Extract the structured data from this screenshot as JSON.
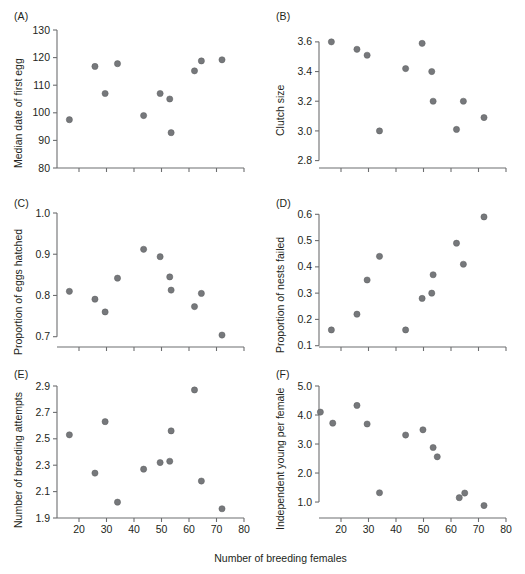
{
  "figure": {
    "width": 525,
    "height": 574,
    "shared_xlabel": "Number of breeding females",
    "point_color": "#76787b",
    "axis_color": "#6d6e70",
    "background": "#ffffff"
  },
  "panels": [
    {
      "label": "(A)",
      "ylabel": "Median date of first egg",
      "xticklabels": [
        "",
        "",
        "",
        "",
        "",
        "",
        "",
        ""
      ],
      "yticklabels": [
        "80",
        "90",
        "100",
        "110",
        "120",
        "130"
      ]
    },
    {
      "label": "(B)",
      "ylabel": "Clutch size",
      "xticklabels": [
        "",
        "",
        "",
        "",
        "",
        "",
        "",
        ""
      ],
      "yticklabels": [
        "2.8",
        "3.0",
        "3.2",
        "3.4",
        "3.6"
      ]
    },
    {
      "label": "(C)",
      "ylabel": "Proportion of eggs hatched",
      "xticklabels": [
        "",
        "",
        "",
        "",
        "",
        "",
        "",
        ""
      ],
      "yticklabels": [
        "0.7",
        "0.8",
        "0.9",
        "1.0"
      ]
    },
    {
      "label": "(D)",
      "ylabel": "Proportion of nests failed",
      "xticklabels": [
        "",
        "",
        "",
        "",
        "",
        "",
        "",
        ""
      ],
      "yticklabels": [
        "0.1",
        "0.2",
        "0.3",
        "0.4",
        "0.5",
        "0.6"
      ]
    },
    {
      "label": "(E)",
      "ylabel": "Number of breeding attempts",
      "xticklabels": [
        "20",
        "30",
        "40",
        "50",
        "60",
        "70",
        "80"
      ],
      "yticklabels": [
        "1.9",
        "2.1",
        "2.3",
        "2.5",
        "2.7",
        "2.9"
      ]
    },
    {
      "label": "(F)",
      "ylabel": "Independent young per female",
      "xticklabels": [
        "20",
        "30",
        "40",
        "50",
        "60",
        "70",
        "80"
      ],
      "yticklabels": [
        "1.0",
        "2.0",
        "3.0",
        "4.0",
        "5.0"
      ]
    }
  ],
  "chart_data": [
    {
      "type": "scatter",
      "panel": "(A)",
      "title": "",
      "xlabel": "Number of breeding females",
      "ylabel": "Median date of first egg",
      "xlim": [
        12,
        80
      ],
      "ylim": [
        80,
        130
      ],
      "xticks": [
        20,
        30,
        40,
        50,
        60,
        70,
        80
      ],
      "yticks": [
        80,
        90,
        100,
        110,
        120,
        130
      ],
      "grid": false,
      "legend": false,
      "x": [
        16.5,
        25.8,
        29.5,
        34.0,
        43.5,
        49.5,
        53.0,
        53.5,
        62.0,
        64.5,
        72.0
      ],
      "y": [
        97.5,
        116.8,
        107.0,
        117.8,
        99.0,
        107.0,
        105.0,
        92.8,
        115.2,
        118.8,
        119.2
      ]
    },
    {
      "type": "scatter",
      "panel": "(B)",
      "title": "",
      "xlabel": "Number of breeding females",
      "ylabel": "Clutch size",
      "xlim": [
        12,
        80
      ],
      "ylim": [
        2.75,
        3.68
      ],
      "xticks": [
        20,
        30,
        40,
        50,
        60,
        70,
        80
      ],
      "yticks": [
        2.8,
        3.0,
        3.2,
        3.4,
        3.6
      ],
      "grid": false,
      "legend": false,
      "x": [
        16.5,
        25.8,
        29.5,
        34.0,
        43.5,
        49.5,
        53.0,
        53.5,
        62.0,
        64.5,
        72.0
      ],
      "y": [
        3.6,
        3.55,
        3.51,
        3.0,
        3.42,
        3.59,
        3.4,
        3.2,
        3.01,
        3.2,
        3.09
      ]
    },
    {
      "type": "scatter",
      "panel": "(C)",
      "title": "",
      "xlabel": "Number of breeding females",
      "ylabel": "Proportion of eggs hatched",
      "xlim": [
        12,
        80
      ],
      "ylim": [
        0.675,
        1.0
      ],
      "xticks": [
        20,
        30,
        40,
        50,
        60,
        70,
        80
      ],
      "yticks": [
        0.7,
        0.8,
        0.9,
        1.0
      ],
      "grid": false,
      "legend": false,
      "x": [
        16.5,
        25.8,
        29.5,
        34.0,
        43.5,
        49.5,
        53.0,
        53.5,
        62.0,
        64.5,
        72.0
      ],
      "y": [
        0.81,
        0.791,
        0.76,
        0.842,
        0.912,
        0.894,
        0.845,
        0.813,
        0.773,
        0.805,
        0.704
      ]
    },
    {
      "type": "scatter",
      "panel": "(D)",
      "title": "",
      "xlabel": "Number of breeding females",
      "ylabel": "Proportion of nests failed",
      "xlim": [
        12,
        80
      ],
      "ylim": [
        0.095,
        0.605
      ],
      "xticks": [
        20,
        30,
        40,
        50,
        60,
        70,
        80
      ],
      "yticks": [
        0.1,
        0.2,
        0.3,
        0.4,
        0.5,
        0.6
      ],
      "grid": false,
      "legend": false,
      "x": [
        16.5,
        25.8,
        29.5,
        34.0,
        43.5,
        49.5,
        53.0,
        53.5,
        62.0,
        64.5,
        72.0
      ],
      "y": [
        0.16,
        0.22,
        0.35,
        0.44,
        0.16,
        0.28,
        0.3,
        0.37,
        0.49,
        0.41,
        0.59
      ]
    },
    {
      "type": "scatter",
      "panel": "(E)",
      "title": "",
      "xlabel": "Number of breeding females",
      "ylabel": "Number of breeding attempts",
      "xlim": [
        12,
        80
      ],
      "ylim": [
        1.9,
        2.9
      ],
      "xticks": [
        20,
        30,
        40,
        50,
        60,
        70,
        80
      ],
      "yticks": [
        1.9,
        2.1,
        2.3,
        2.5,
        2.7,
        2.9
      ],
      "grid": false,
      "legend": false,
      "x": [
        16.5,
        25.8,
        29.5,
        34.0,
        43.5,
        49.5,
        53.0,
        53.5,
        62.0,
        64.5,
        72.0
      ],
      "y": [
        2.53,
        2.24,
        2.63,
        2.02,
        2.27,
        2.32,
        2.33,
        2.56,
        2.87,
        2.18,
        1.97
      ]
    },
    {
      "type": "scatter",
      "panel": "(F)",
      "title": "",
      "xlabel": "Number of breeding females",
      "ylabel": "Independent young per female",
      "xlim": [
        12,
        80
      ],
      "ylim": [
        0.45,
        5.0
      ],
      "xticks": [
        20,
        30,
        40,
        50,
        60,
        70,
        80
      ],
      "yticks": [
        1.0,
        2.0,
        3.0,
        4.0,
        5.0
      ],
      "grid": false,
      "legend": false,
      "x": [
        12.5,
        17.0,
        25.8,
        29.5,
        34.0,
        43.5,
        49.8,
        53.5,
        55.0,
        63.0,
        65.0,
        72.0
      ],
      "y": [
        4.1,
        3.72,
        4.33,
        3.69,
        1.32,
        3.31,
        3.49,
        2.88,
        2.56,
        1.15,
        1.31,
        0.88
      ]
    }
  ]
}
